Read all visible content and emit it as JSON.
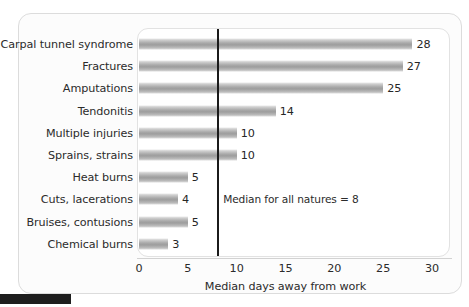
{
  "chart_data": {
    "type": "bar",
    "orientation": "horizontal",
    "title": "",
    "subtitle": "",
    "xlabel": "Median days away from work",
    "ylabel": "",
    "xlim": [
      0,
      30
    ],
    "xticks": [
      0,
      5,
      10,
      15,
      20,
      25,
      30
    ],
    "grid": false,
    "legend": null,
    "categories": [
      "Carpal tunnel syndrome",
      "Fractures",
      "Amputations",
      "Tendonitis",
      "Multiple injuries",
      "Sprains, strains",
      "Heat burns",
      "Cuts, lacerations",
      "Bruises, contusions",
      "Chemical burns"
    ],
    "values": [
      28,
      27,
      25,
      14,
      10,
      10,
      5,
      4,
      5,
      3
    ],
    "value_labels": [
      "28",
      "27",
      "25",
      "14",
      "10",
      "10",
      "5",
      "4",
      "5",
      "3"
    ],
    "annotations": [
      {
        "name": "median-reference",
        "text": "Median for all natures = 8",
        "value": 8,
        "type": "vline"
      }
    ],
    "colors": {
      "bar": "#a8a8a8",
      "bar_highlight": "#e9e9e9",
      "reference_line": "#1b1b1b",
      "text": "#2b2b2b",
      "panel_background": "#ffffff",
      "card_background": "#fcfcfc",
      "page_background": "#ffffff"
    }
  }
}
